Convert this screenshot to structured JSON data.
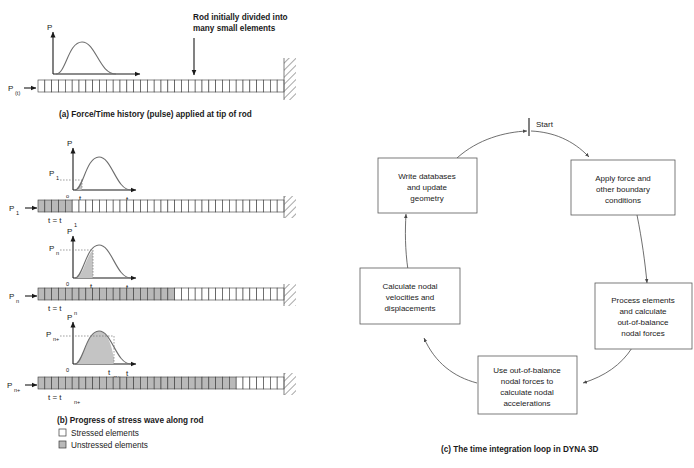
{
  "figure": {
    "panel_a": {
      "annotation": "Rod initially divided into\nmany small elements",
      "annotation_line1": "Rod initially divided into",
      "annotation_line2": "many small elements",
      "force_label": "P",
      "force_label_sub": "(t)",
      "graph": {
        "y_axis": "P",
        "x_axis": "t"
      },
      "caption": "(a) Force/Time history (pulse) applied at tip of rod",
      "rod_elements": 36,
      "stressed_elements": 0
    },
    "panel_b": {
      "caption": "(b) Progress of stress wave along rod",
      "legend": [
        {
          "key": "stressed",
          "label": "Stressed elements",
          "swatch": "#ffffff"
        },
        {
          "key": "unstressed",
          "label": "Unstressed elements",
          "swatch": "#b9b9b9"
        }
      ],
      "stages": [
        {
          "force_label": "P",
          "force_sub": "1",
          "graph": {
            "y_axis": "P",
            "x_axis": "t",
            "origin": "o",
            "level_label": "P",
            "level_sub": "1",
            "time_label": "t",
            "time_sub": "1"
          },
          "time_caption_prefix": "t = t",
          "time_caption_sub": "1",
          "rod_elements": 36,
          "stressed_elements": 5
        },
        {
          "force_label": "P",
          "force_sub": "n",
          "graph": {
            "y_axis": "P",
            "x_axis": "t",
            "origin": "0",
            "level_label": "P",
            "level_sub": "n",
            "time_label": "t",
            "time_sub": "n"
          },
          "time_caption_prefix": "t = t",
          "time_caption_sub": "n",
          "rod_elements": 36,
          "stressed_elements": 20
        },
        {
          "force_label": "P",
          "force_sub": "n+",
          "graph": {
            "y_axis": "P",
            "x_axis": "t",
            "origin": "0",
            "level_label": "P",
            "level_sub": "n+",
            "time_label": "t",
            "time_sub": "n+"
          },
          "time_caption_prefix": "t = t",
          "time_caption_sub": "n+",
          "rod_elements": 36,
          "stressed_elements": 29
        }
      ]
    },
    "panel_c": {
      "start_label": "Start",
      "caption": "(c) The time integration loop in DYNA 3D",
      "boxes": [
        {
          "id": "write-databases",
          "lines": [
            "Write databases",
            "and update",
            "geometry"
          ]
        },
        {
          "id": "apply-force",
          "lines": [
            "Apply force and",
            "other boundary",
            "conditions"
          ]
        },
        {
          "id": "process-elements",
          "lines": [
            "Process elements",
            "and calculate",
            "out-of-balance",
            "nodal forces"
          ]
        },
        {
          "id": "use-out-of-balance",
          "lines": [
            "Use out-of-balance",
            "nodal forces to",
            "calculate nodal",
            "accelerations"
          ]
        },
        {
          "id": "calculate-nodal",
          "lines": [
            "Calculate nodal",
            "velocities and",
            "displacements"
          ]
        }
      ]
    }
  },
  "colors": {
    "stressed_fill": "#ffffff",
    "unstressed_fill": "#b9b9b9",
    "stroke": "#3a3a3a",
    "curve": "#6e6e6e",
    "text": "#1a1a1a"
  }
}
